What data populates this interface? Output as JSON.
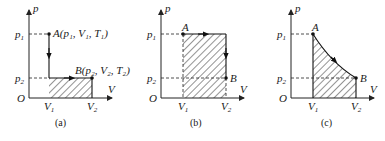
{
  "panels": [
    {
      "id": "a",
      "caption": "(a)",
      "axis_y_label": "p",
      "axis_x_label": "V",
      "origin_label": "O",
      "p_ticks": [
        {
          "label": "p",
          "sub": "1"
        },
        {
          "label": "p",
          "sub": "2"
        }
      ],
      "v_ticks": [
        {
          "label": "V",
          "sub": "1"
        },
        {
          "label": "V",
          "sub": "2"
        }
      ],
      "point_a_label": "A(p₁, V₁, T₁)",
      "point_b_label": "B(p₂, V₂, T₂)",
      "process": "isochoric decrease A→(V1,p2) then isobaric expansion to B; hatched area under p2 from V1 to V2"
    },
    {
      "id": "b",
      "caption": "(b)",
      "axis_y_label": "p",
      "axis_x_label": "V",
      "origin_label": "O",
      "p_ticks": [
        {
          "label": "p",
          "sub": "1"
        },
        {
          "label": "p",
          "sub": "2"
        }
      ],
      "v_ticks": [
        {
          "label": "V",
          "sub": "1"
        },
        {
          "label": "V",
          "sub": "2"
        }
      ],
      "point_a_label": "A",
      "point_b_label": "B",
      "process": "isobaric expansion at p1 from A to V2 then isochoric decrease to B; hatched area under p1 from V1 to V2"
    },
    {
      "id": "c",
      "caption": "(c)",
      "axis_y_label": "p",
      "axis_x_label": "V",
      "origin_label": "O",
      "p_ticks": [
        {
          "label": "p",
          "sub": "1"
        },
        {
          "label": "p",
          "sub": "2"
        }
      ],
      "v_ticks": [
        {
          "label": "V",
          "sub": "1"
        },
        {
          "label": "V",
          "sub": "2"
        }
      ],
      "point_a_label": "A",
      "point_b_label": "B",
      "process": "isothermal curve from A to B; hatched area under curve from V1 to V2"
    }
  ]
}
